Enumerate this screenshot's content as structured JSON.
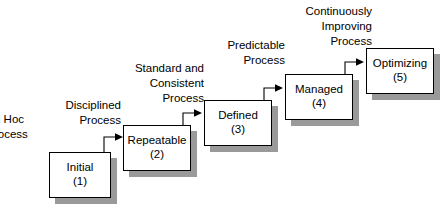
{
  "diagram": {
    "type": "staircase-flow",
    "colors": {
      "box_fill": "#ffffff",
      "box_border": "#000000",
      "shadow": "#9a9a9a",
      "text": "#000000",
      "background": "#ffffff"
    },
    "nodes": [
      {
        "name": "Initial",
        "level": "(1)"
      },
      {
        "name": "Repeatable",
        "level": "(2)"
      },
      {
        "name": "Defined",
        "level": "(3)"
      },
      {
        "name": "Managed",
        "level": "(4)"
      },
      {
        "name": "Optimizing",
        "level": "(5)"
      }
    ],
    "captions": [
      {
        "lines": [
          "d Hoc",
          "rocess"
        ]
      },
      {
        "lines": [
          "Disciplined",
          "Process"
        ]
      },
      {
        "lines": [
          "Standard and",
          "Consistent",
          "Process"
        ]
      },
      {
        "lines": [
          "Predictable",
          "Process"
        ]
      },
      {
        "lines": [
          "Continuously",
          "Improving",
          "Process"
        ]
      }
    ]
  }
}
